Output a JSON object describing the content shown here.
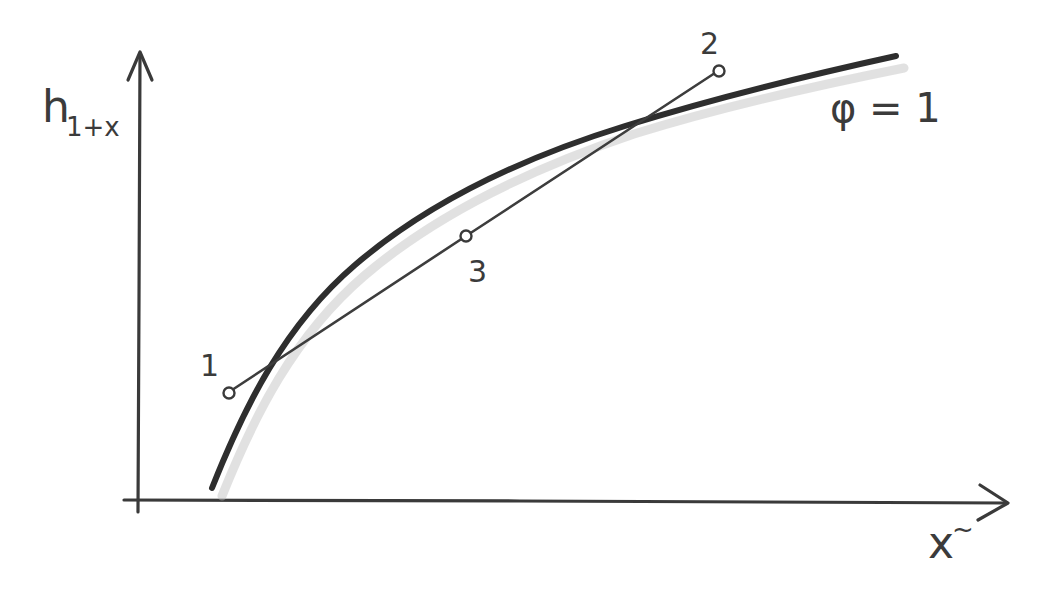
{
  "diagram": {
    "type": "hand-drawn Mollier h-x diagram",
    "y_axis": {
      "label_main": "h",
      "label_sub": "1+x"
    },
    "x_axis": {
      "label_main": "x",
      "label_sup": "~"
    },
    "curve": {
      "label": "φ = 1",
      "description": "saturation curve"
    },
    "points": [
      {
        "id": "1",
        "label": "1"
      },
      {
        "id": "2",
        "label": "2"
      },
      {
        "id": "3",
        "label": "3"
      }
    ],
    "colors": {
      "ink": "#333333",
      "shade": "#bdbdbd",
      "background": "#ffffff"
    }
  }
}
